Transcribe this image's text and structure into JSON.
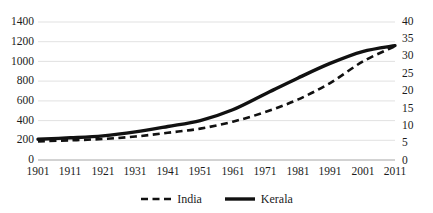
{
  "chart_data": {
    "type": "line",
    "title": "",
    "xlabel": "",
    "ylabel": "",
    "categories": [
      "1901",
      "1911",
      "1921",
      "1931",
      "1941",
      "1951",
      "1961",
      "1971",
      "1981",
      "1991",
      "2001",
      "2011"
    ],
    "grid": true,
    "legend_position": "bottom",
    "axes": {
      "left": {
        "ticks": [
          "0",
          "200",
          "400",
          "600",
          "800",
          "1000",
          "1200",
          "1400"
        ],
        "tick_values": [
          0,
          200,
          400,
          600,
          800,
          1000,
          1200,
          1400
        ],
        "ylim": [
          0,
          1400
        ],
        "series": "Kerala"
      },
      "right": {
        "ticks": [
          "0",
          "5",
          "10",
          "15",
          "20",
          "25",
          "30",
          "35",
          "40"
        ],
        "tick_values": [
          0,
          5,
          10,
          15,
          20,
          25,
          30,
          35,
          40
        ],
        "ylim": [
          0,
          40
        ],
        "series": "India"
      }
    },
    "series": [
      {
        "name": "India",
        "axis": "right",
        "style": "dashed",
        "color": "#111111",
        "values": [
          5.4,
          5.7,
          6.1,
          6.8,
          7.9,
          9.1,
          11.1,
          13.9,
          17.5,
          22.3,
          28.5,
          33.0
        ]
      },
      {
        "name": "Kerala",
        "axis": "left",
        "style": "solid",
        "color": "#111111",
        "values": [
          210,
          225,
          245,
          285,
          340,
          400,
          510,
          670,
          830,
          980,
          1100,
          1160
        ]
      }
    ]
  },
  "legend": {
    "items": [
      {
        "label": "India",
        "style": "dashed"
      },
      {
        "label": "Kerala",
        "style": "solid"
      }
    ]
  }
}
